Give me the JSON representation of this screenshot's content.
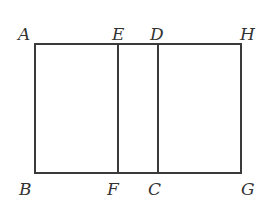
{
  "diagram": {
    "type": "geometry",
    "colors": {
      "line": "#3a3a3a",
      "text": "#333333",
      "background": "#ffffff"
    },
    "points": {
      "A": {
        "label": "A",
        "x": 35,
        "y": 44
      },
      "E": {
        "label": "E",
        "x": 118,
        "y": 44
      },
      "D": {
        "label": "D",
        "x": 158,
        "y": 44
      },
      "H": {
        "label": "H",
        "x": 241,
        "y": 44
      },
      "B": {
        "label": "B",
        "x": 35,
        "y": 173
      },
      "F": {
        "label": "F",
        "x": 118,
        "y": 173
      },
      "C": {
        "label": "C",
        "x": 158,
        "y": 173
      },
      "G": {
        "label": "G",
        "x": 241,
        "y": 173
      }
    },
    "segments": [
      [
        "A",
        "H"
      ],
      [
        "B",
        "G"
      ],
      [
        "A",
        "B"
      ],
      [
        "H",
        "G"
      ],
      [
        "E",
        "F"
      ],
      [
        "D",
        "C"
      ]
    ]
  }
}
